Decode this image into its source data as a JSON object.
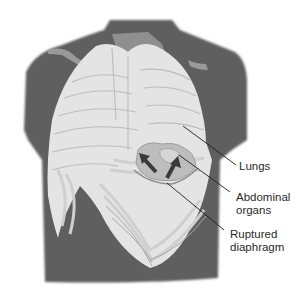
{
  "figure": {
    "colors": {
      "background": "#ffffff",
      "torso": "#5e5e5e",
      "lungs": "#e6e6e6",
      "ribs": "#d2d2d2",
      "organs": "#bdbdbd",
      "arrows": "#3a3a3a",
      "leader_lines": "#1e1e1e"
    },
    "arrows": [
      {
        "name": "left-herniation-arrow",
        "direction": "up-left"
      },
      {
        "name": "right-herniation-arrow",
        "direction": "up-right"
      }
    ]
  },
  "labels": {
    "lungs": "Lungs",
    "abdominal_line1": "Abdominal",
    "abdominal_line2": "organs",
    "ruptured_line1": "Ruptured",
    "ruptured_line2": "diaphragm"
  }
}
